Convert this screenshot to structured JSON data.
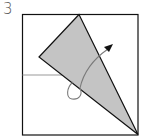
{
  "diagram": {
    "type": "origami-step",
    "step_number": "3",
    "colors": {
      "paper_outline": "#111111",
      "folded_flap_fill": "#c4c4c4",
      "crease_line": "#999999",
      "arrow": "#7a7a7a",
      "arrow_head": "#111111"
    },
    "elements": [
      {
        "name": "paper-rectangle",
        "x": 22,
        "y": 14,
        "width": 116,
        "height": 121
      },
      {
        "name": "folded-flap-triangle",
        "points": [
          [
            79,
            14
          ],
          [
            39,
            57
          ],
          [
            138,
            135
          ]
        ]
      },
      {
        "name": "reference-crease-line",
        "from": [
          22,
          75
        ],
        "to": [
          72,
          75
        ]
      },
      {
        "name": "fold-arrow",
        "description": "curved arrow looping behind flap, pointing up-right"
      }
    ]
  }
}
